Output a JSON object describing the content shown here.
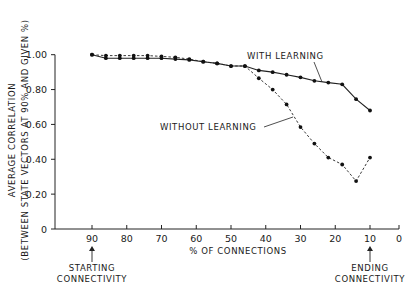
{
  "chart_data": {
    "type": "line",
    "title": "",
    "xlabel": "% OF CONNECTIONS",
    "ylabel_line1": "AVERAGE CORRELATION",
    "ylabel_line2": "(BETWEEN STATE VECTORS AT 90% AND GIVEN %)",
    "xlim": [
      100,
      0
    ],
    "ylim": [
      0,
      1.0
    ],
    "x_ticks": [
      90,
      80,
      70,
      60,
      50,
      40,
      30,
      20,
      10,
      0
    ],
    "y_ticks": [
      {
        "value": 0,
        "label": "0"
      },
      {
        "value": 0.2,
        "label": "0.20"
      },
      {
        "value": 0.4,
        "label": "0.40"
      },
      {
        "value": 0.6,
        "label": "0.60"
      },
      {
        "value": 0.8,
        "label": "0.80"
      },
      {
        "value": 1.0,
        "label": "1.00"
      }
    ],
    "grid": false,
    "x": [
      90,
      86,
      82,
      78,
      74,
      70,
      66,
      62,
      58,
      54,
      50,
      46,
      42,
      38,
      34,
      30,
      26,
      22,
      18,
      14,
      10
    ],
    "series": [
      {
        "name": "WITH LEARNING",
        "style": "solid",
        "values": [
          1.0,
          0.98,
          0.98,
          0.98,
          0.98,
          0.98,
          0.975,
          0.97,
          0.96,
          0.95,
          0.935,
          0.935,
          0.91,
          0.9,
          0.885,
          0.87,
          0.85,
          0.84,
          0.83,
          0.745,
          0.68
        ]
      },
      {
        "name": "WITHOUT LEARNING",
        "style": "dashed",
        "values": [
          1.0,
          0.995,
          0.995,
          0.995,
          0.995,
          0.99,
          0.985,
          0.975,
          0.96,
          0.95,
          0.935,
          0.935,
          0.865,
          0.8,
          0.715,
          0.585,
          0.49,
          0.41,
          0.37,
          0.275,
          0.41
        ]
      }
    ],
    "annotations": [
      {
        "text": "WITH LEARNING",
        "series": 0
      },
      {
        "text": "WITHOUT LEARNING",
        "series": 1
      },
      {
        "text_line1": "STARTING",
        "text_line2": "CONNECTIVITY",
        "at_x": 90
      },
      {
        "text_line1": "ENDING",
        "text_line2": "CONNECTIVITY",
        "at_x": 10
      }
    ]
  }
}
